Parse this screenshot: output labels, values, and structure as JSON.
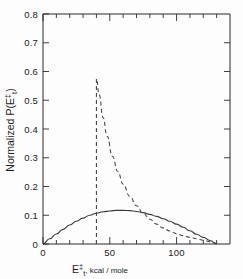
{
  "chart_data": {
    "type": "line",
    "title": "",
    "xlabel": "E‡t, kcal/mole",
    "ylabel": "Normalized P(E‡t)",
    "xlim": [
      0,
      140
    ],
    "ylim": [
      0,
      0.8
    ],
    "grid": false,
    "legend": "none",
    "x_ticks_major": [
      0,
      50,
      100
    ],
    "x_tick_labels": [
      "0",
      "50",
      "100"
    ],
    "x_ticks_minor_step": 10,
    "y_ticks": [
      0,
      0.1,
      0.2,
      0.3,
      0.4,
      0.5,
      0.6,
      0.7,
      0.8
    ],
    "y_tick_labels": [
      "0",
      "0.1",
      "0.2",
      "0.3",
      "0.4",
      "0.5",
      "0.6",
      "0.7",
      "0.8"
    ],
    "series": [
      {
        "name": "statistical-prior-distribution",
        "style": "dashed",
        "color": "#4a4a4a",
        "x": [
          40,
          40,
          42,
          45,
          48,
          52,
          56,
          60,
          65,
          70,
          75,
          80,
          85,
          90,
          95,
          100,
          105,
          110,
          115,
          120,
          125,
          130
        ],
        "y": [
          0.0,
          0.575,
          0.52,
          0.44,
          0.375,
          0.305,
          0.252,
          0.208,
          0.166,
          0.133,
          0.107,
          0.086,
          0.069,
          0.056,
          0.045,
          0.036,
          0.029,
          0.023,
          0.018,
          0.013,
          0.008,
          0.003
        ]
      },
      {
        "name": "observed-translational-energy-distribution",
        "style": "solid",
        "color": "#3a3a3a",
        "x": [
          0,
          5,
          10,
          15,
          20,
          25,
          30,
          35,
          40,
          45,
          50,
          55,
          60,
          65,
          70,
          75,
          80,
          85,
          90,
          95,
          100,
          105,
          110,
          115,
          120,
          125,
          130
        ],
        "y": [
          0.0,
          0.018,
          0.035,
          0.051,
          0.066,
          0.079,
          0.09,
          0.1,
          0.107,
          0.112,
          0.115,
          0.117,
          0.117,
          0.116,
          0.113,
          0.109,
          0.103,
          0.096,
          0.088,
          0.079,
          0.069,
          0.058,
          0.046,
          0.034,
          0.023,
          0.012,
          0.0
        ]
      }
    ]
  },
  "labels": {
    "y_axis_prefix": "Normalized  P(E",
    "y_axis_suffix": ")",
    "x_axis_units": ", kcal / mole",
    "symbol_E": "E",
    "symbol_dagger": "‡",
    "symbol_t": "t"
  }
}
